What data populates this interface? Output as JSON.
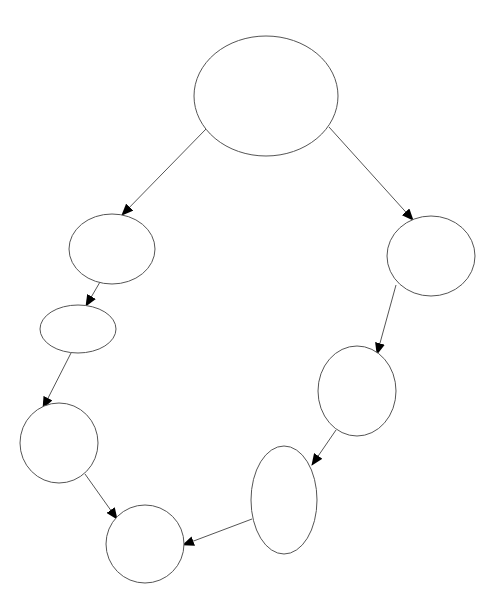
{
  "diagram": {
    "type": "directed-graph",
    "width": 498,
    "height": 613,
    "background": "#ffffff",
    "stroke_color": "#555555",
    "arrow_color": "#000000",
    "nodes": [
      {
        "id": "n0",
        "label": "",
        "cx": 266,
        "cy": 96,
        "rx": 72,
        "ry": 60
      },
      {
        "id": "n1",
        "label": "",
        "cx": 112,
        "cy": 249,
        "rx": 43,
        "ry": 35
      },
      {
        "id": "n2",
        "label": "",
        "cx": 78,
        "cy": 329,
        "rx": 38,
        "ry": 24
      },
      {
        "id": "n3",
        "label": "",
        "cx": 59,
        "cy": 443,
        "rx": 39,
        "ry": 40
      },
      {
        "id": "n4",
        "label": "",
        "cx": 145,
        "cy": 544,
        "rx": 39,
        "ry": 39
      },
      {
        "id": "n5",
        "label": "",
        "cx": 431,
        "cy": 256,
        "rx": 44,
        "ry": 40
      },
      {
        "id": "n6",
        "label": "",
        "cx": 357,
        "cy": 391,
        "rx": 39,
        "ry": 45
      },
      {
        "id": "n7",
        "label": "",
        "cx": 284,
        "cy": 500,
        "rx": 33,
        "ry": 54
      }
    ],
    "edges": [
      {
        "from": "n0",
        "to": "n1",
        "x1": 206,
        "y1": 129,
        "x2": 122,
        "y2": 215
      },
      {
        "from": "n0",
        "to": "n5",
        "x1": 329,
        "y1": 127,
        "x2": 413,
        "y2": 220
      },
      {
        "from": "n1",
        "to": "n2",
        "x1": 100,
        "y1": 282,
        "x2": 86,
        "y2": 306
      },
      {
        "from": "n2",
        "to": "n3",
        "x1": 71,
        "y1": 353,
        "x2": 43,
        "y2": 408
      },
      {
        "from": "n3",
        "to": "n4",
        "x1": 85,
        "y1": 474,
        "x2": 117,
        "y2": 519
      },
      {
        "from": "n5",
        "to": "n6",
        "x1": 396,
        "y1": 285,
        "x2": 377,
        "y2": 354
      },
      {
        "from": "n6",
        "to": "n7",
        "x1": 336,
        "y1": 430,
        "x2": 312,
        "y2": 465
      },
      {
        "from": "n7",
        "to": "n4",
        "x1": 252,
        "y1": 519,
        "x2": 183,
        "y2": 545
      }
    ]
  }
}
